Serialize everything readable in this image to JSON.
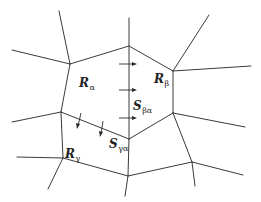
{
  "diagram": {
    "title": "",
    "stroke_color": "#3a3a3a",
    "background": "#ffffff",
    "regions": [
      {
        "id": "R_alpha",
        "symbol": "R",
        "subscript": "α"
      },
      {
        "id": "R_beta",
        "symbol": "R",
        "subscript": "β"
      },
      {
        "id": "R_gamma",
        "symbol": "R",
        "subscript": "γ"
      }
    ],
    "interfaces": [
      {
        "id": "S_beta_alpha",
        "symbol": "S",
        "subscript": "βα"
      },
      {
        "id": "S_gamma_alpha",
        "symbol": "S",
        "subscript": "γα"
      }
    ],
    "labels": {
      "r_alpha": {
        "main": "R",
        "sub": "α"
      },
      "r_beta": {
        "main": "R",
        "sub": "β"
      },
      "r_gamma": {
        "main": "R",
        "sub": "γ"
      },
      "s_beta_alpha": {
        "main": "S",
        "sub": "βα"
      },
      "s_gamma_alpha": {
        "main": "S",
        "sub": "γα"
      }
    }
  }
}
